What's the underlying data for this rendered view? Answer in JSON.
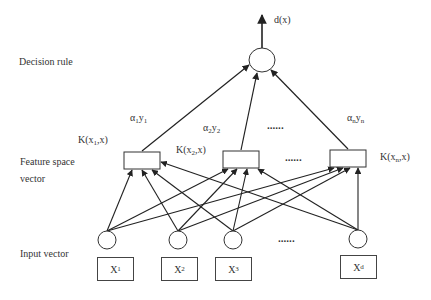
{
  "layers": {
    "decision": {
      "label": "Decision rule",
      "output": "d(x)"
    },
    "feature": {
      "label_line1": "Feature  space",
      "label_line2": "vector"
    },
    "input": {
      "label": "Input vector"
    }
  },
  "weights": [
    {
      "alpha": "α",
      "asub": "1",
      "y": "y",
      "ysub": "1"
    },
    {
      "alpha": "α",
      "asub": "2",
      "y": "y",
      "ysub": "2"
    },
    {
      "alpha": "α",
      "asub": "n",
      "y": "y",
      "ysub": "n"
    }
  ],
  "kernels": [
    {
      "pre": "K(x",
      "sub": "1",
      "post": ",x)"
    },
    {
      "pre": "K(x",
      "sub": "2",
      "post": ",x)"
    },
    {
      "pre": "K(x",
      "sub": "n",
      "post": ",x)"
    }
  ],
  "inputs": [
    {
      "base": "X",
      "sup": "1"
    },
    {
      "base": "X",
      "sup": "2"
    },
    {
      "base": "X",
      "sup": "3"
    },
    {
      "base": "X",
      "sup": "d"
    }
  ],
  "ellipsis": "......",
  "colors": {
    "line": "#222222",
    "text": "#333333",
    "background": "#ffffff"
  }
}
